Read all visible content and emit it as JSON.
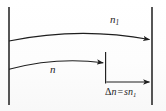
{
  "figure": {
    "type": "diagram",
    "background_color": "#fefefe",
    "stroke_color": "#1e1e1e",
    "labels": {
      "upper_curve": "n",
      "upper_curve_subscript": "1",
      "lower_curve": "n",
      "equation_delta_symbol": "Δ",
      "equation_lhs_variable": "n",
      "equation_operator": "=",
      "equation_rhs_coefficient": "s",
      "equation_rhs_variable": "n",
      "equation_rhs_subscript": "1"
    },
    "elements": [
      {
        "name": "left-vertical-line",
        "kind": "line",
        "x1": 9,
        "y1": 7,
        "x2": 9,
        "y2": 105
      },
      {
        "name": "right-vertical-line",
        "kind": "line",
        "x1": 152,
        "y1": 7,
        "x2": 152,
        "y2": 105
      },
      {
        "name": "middle-vertical-tick",
        "kind": "line",
        "x1": 105.5,
        "y1": 52,
        "x2": 105.5,
        "y2": 83
      },
      {
        "name": "upper-curved-arrow",
        "kind": "curve",
        "start": [
          9,
          41
        ],
        "control": [
          80,
          27
        ],
        "end": [
          150,
          40
        ],
        "arrow_at": "end"
      },
      {
        "name": "lower-curved-arrow",
        "kind": "curve",
        "start": [
          9,
          69
        ],
        "control": [
          58,
          57
        ],
        "end": [
          104,
          63
        ],
        "arrow_at": "end"
      },
      {
        "name": "delta-n-horizontal-arrow",
        "kind": "line",
        "x1": 106,
        "y1": 82,
        "x2": 150,
        "y2": 82,
        "arrow_at": "end"
      }
    ]
  }
}
